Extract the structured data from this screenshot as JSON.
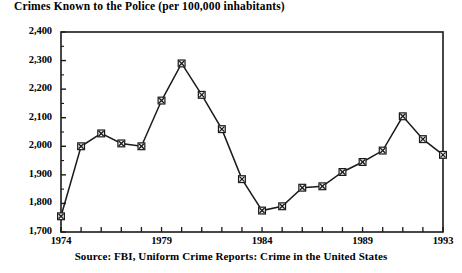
{
  "chart_data": {
    "type": "line",
    "title": "Crimes Known to the Police (per 100,000 inhabitants)",
    "source": "Source: FBI, Uniform Crime Reports: Crime in the United States",
    "xlabel": "",
    "ylabel": "",
    "grid": false,
    "legend": "none",
    "marker": "square-with-x",
    "x": [
      1974,
      1975,
      1976,
      1977,
      1978,
      1979,
      1980,
      1981,
      1982,
      1983,
      1984,
      1985,
      1986,
      1987,
      1988,
      1989,
      1990,
      1991,
      1992,
      1993
    ],
    "values": [
      1755,
      2000,
      2045,
      2010,
      2000,
      2160,
      2290,
      2180,
      2060,
      1885,
      1775,
      1790,
      1855,
      1860,
      1910,
      1945,
      1985,
      2105,
      2025,
      1970
    ],
    "xlim": [
      1974,
      1993
    ],
    "ylim": [
      1700,
      2400
    ],
    "ytick_labels": [
      "2,400",
      "2,300",
      "2,200",
      "2,100",
      "2,000",
      "1,900",
      "1,800",
      "1,700"
    ],
    "ytick_values": [
      2400,
      2300,
      2200,
      2100,
      2000,
      1900,
      1800,
      1700
    ],
    "xtick_labels": [
      "1974",
      "1979",
      "1984",
      "1989",
      "1993"
    ],
    "xtick_values": [
      1974,
      1979,
      1984,
      1989,
      1993
    ],
    "colors": {
      "line": "#1a1a1a",
      "marker_fill": "#f2f2f2",
      "marker_edge": "#1a1a1a",
      "axis": "#1a1a1a",
      "background": "#ffffff"
    }
  }
}
